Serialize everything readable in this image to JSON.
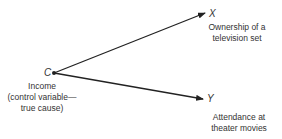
{
  "diagram": {
    "type": "causal-diagram",
    "nodes": {
      "c": {
        "symbol": "C",
        "label_lines": [
          "Income",
          "(control variable—",
          "true cause)"
        ]
      },
      "x": {
        "symbol": "X",
        "label_lines": [
          "Ownership of a",
          "television set"
        ]
      },
      "y": {
        "symbol": "Y",
        "label_lines": [
          "Attendance at",
          "theater movies"
        ]
      }
    },
    "edges": [
      {
        "from": "C",
        "to": "X"
      },
      {
        "from": "C",
        "to": "Y"
      }
    ],
    "colors": {
      "line": "#222222",
      "text": "#333333",
      "background": "#ffffff"
    }
  }
}
